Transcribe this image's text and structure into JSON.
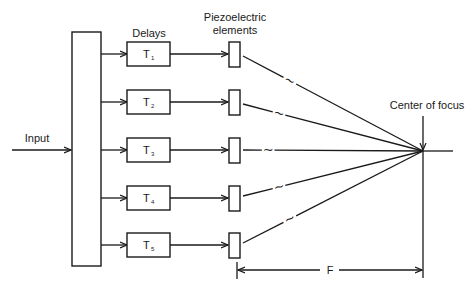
{
  "labels": {
    "input": "Input",
    "delays": "Delays",
    "piezo_line1": "Piezoelectric",
    "piezo_line2": "elements",
    "center_of_focus": "Center of focus",
    "focal_length": "F"
  },
  "channels": [
    {
      "delay_main": "T",
      "delay_sub": "1",
      "tilde": "~"
    },
    {
      "delay_main": "T",
      "delay_sub": "2",
      "tilde": "~"
    },
    {
      "delay_main": "T",
      "delay_sub": "3",
      "tilde": "~"
    },
    {
      "delay_main": "T",
      "delay_sub": "4",
      "tilde": "~"
    },
    {
      "delay_main": "T",
      "delay_sub": "5",
      "tilde": "~"
    }
  ],
  "colors": {
    "ink": "#1a1a1a",
    "background": "#ffffff"
  }
}
